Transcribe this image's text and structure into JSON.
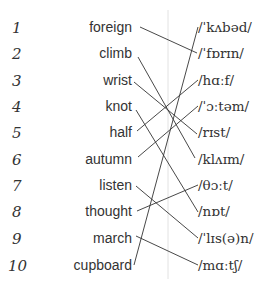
{
  "exercise": {
    "numbers": [
      "1",
      "2",
      "3",
      "4",
      "5",
      "6",
      "7",
      "8",
      "9",
      "10"
    ],
    "words": [
      "foreign",
      "climb",
      "wrist",
      "knot",
      "half",
      "autumn",
      "listen",
      "thought",
      "march",
      "cupboard"
    ],
    "ipa": [
      "/ˈkʌbəd/",
      "/ˈfɒrɪn/",
      "/hɑːf/",
      "/ˈɔːtəm/",
      "/rɪst/",
      "/klʌɪm/",
      "/θɔːt/",
      "/nɒt/",
      "/ˈlɪs(ə)n/",
      "/mɑːtʃ/"
    ],
    "matches": [
      {
        "word": "foreign",
        "ipa": "/ˈfɒrɪn/"
      },
      {
        "word": "climb",
        "ipa": "/klʌɪm/"
      },
      {
        "word": "wrist",
        "ipa": "/rɪst/"
      },
      {
        "word": "knot",
        "ipa": "/nɒt/"
      },
      {
        "word": "half",
        "ipa": "/hɑːf/"
      },
      {
        "word": "autumn",
        "ipa": "/ˈɔːtəm/"
      },
      {
        "word": "listen",
        "ipa": "/ˈlɪs(ə)n/"
      },
      {
        "word": "thought",
        "ipa": "/θɔːt/"
      },
      {
        "word": "march",
        "ipa": "/mɑːtʃ/"
      },
      {
        "word": "cupboard",
        "ipa": "/ˈkʌbəd/"
      }
    ],
    "line_color": "#333333",
    "divider_color": "#dddddd"
  }
}
